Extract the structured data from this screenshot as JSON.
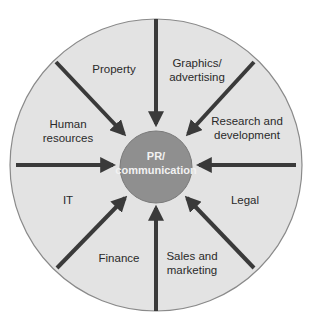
{
  "diagram": {
    "type": "hub-and-spoke",
    "center": {
      "label_line1": "PR/",
      "label_line2": "communication",
      "fill": "#8f8f8f"
    },
    "ring_fill": "#e3e3e3",
    "ring_stroke": "#8a8a8a",
    "arrow_color": "#3a3a3a",
    "segments": [
      {
        "id": "property",
        "line1": "Property",
        "line2": ""
      },
      {
        "id": "graphics",
        "line1": "Graphics/",
        "line2": "advertising"
      },
      {
        "id": "research",
        "line1": "Research and",
        "line2": "development"
      },
      {
        "id": "legal",
        "line1": "Legal",
        "line2": ""
      },
      {
        "id": "sales",
        "line1": "Sales and",
        "line2": "marketing"
      },
      {
        "id": "finance",
        "line1": "Finance",
        "line2": ""
      },
      {
        "id": "it",
        "line1": "IT",
        "line2": ""
      },
      {
        "id": "hr",
        "line1": "Human",
        "line2": "resources"
      }
    ]
  }
}
